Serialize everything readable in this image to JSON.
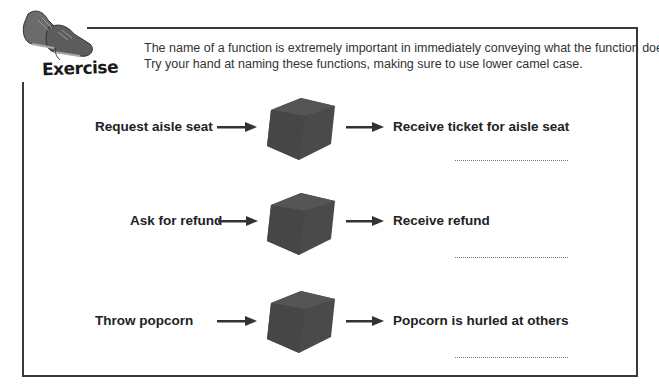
{
  "header": {
    "badge_label": "Exercise",
    "badge_icon": "sneakers-icon",
    "instructions": [
      "The name of a function is extremely important in immediately conveying what the function does.",
      "Try your hand at naming these functions, making sure to use lower camel case."
    ]
  },
  "rows": [
    {
      "input": "Request aisle seat",
      "output": "Receive ticket for aisle seat",
      "answer": ""
    },
    {
      "input": "Ask for refund",
      "output": "Receive refund",
      "answer": ""
    },
    {
      "input": "Throw popcorn",
      "output": "Popcorn is hurled at others",
      "answer": ""
    }
  ],
  "colors": {
    "border": "#3a3a3a",
    "cube": "#4a4a4a",
    "text": "#222222"
  }
}
